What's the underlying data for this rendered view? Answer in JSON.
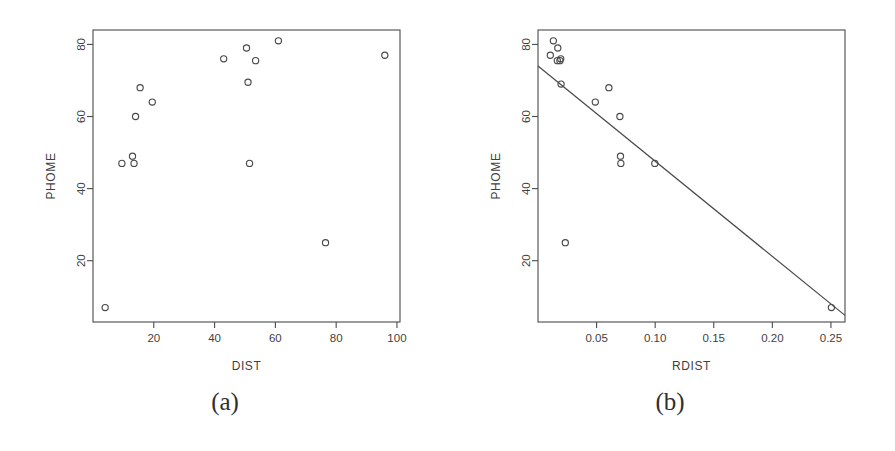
{
  "figure": {
    "background_color": "#ffffff",
    "ink_color": "#4a4a4a",
    "panels": [
      {
        "id": "a",
        "caption": "(a)",
        "xlabel": "DIST",
        "ylabel": "PHOME"
      },
      {
        "id": "b",
        "caption": "(b)",
        "xlabel": "RDIST",
        "ylabel": "PHOME"
      }
    ]
  },
  "chart_data": [
    {
      "type": "scatter",
      "panel": "a",
      "title": "",
      "xlabel": "DIST",
      "ylabel": "PHOME",
      "xlim": [
        0,
        101
      ],
      "ylim": [
        3,
        84
      ],
      "xticks": [
        20,
        40,
        60,
        80,
        100
      ],
      "xtick_labels": [
        "20",
        "40",
        "60",
        "80",
        "100"
      ],
      "yticks": [
        20,
        40,
        60,
        80
      ],
      "ytick_labels": [
        "20",
        "40",
        "60",
        "80"
      ],
      "grid": false,
      "legend": "none",
      "marker": "open-circle",
      "x": [
        4,
        9.5,
        13,
        13.5,
        14,
        15.5,
        19.5,
        43,
        50.5,
        51,
        51.5,
        53.5,
        61,
        76.5,
        96
      ],
      "y": [
        7,
        47,
        49,
        47,
        60,
        68,
        64,
        76,
        79,
        69.5,
        47,
        75.5,
        81,
        25,
        77
      ]
    },
    {
      "type": "scatter",
      "panel": "b",
      "title": "",
      "xlabel": "RDIST",
      "ylabel": "PHOME",
      "xlim": [
        0,
        0.262
      ],
      "ylim": [
        3,
        84
      ],
      "xticks": [
        0.05,
        0.1,
        0.15,
        0.2,
        0.25
      ],
      "xtick_labels": [
        "0.05",
        "0.10",
        "0.15",
        "0.20",
        "0.25"
      ],
      "yticks": [
        20,
        40,
        60,
        80
      ],
      "ytick_labels": [
        "20",
        "40",
        "60",
        "80"
      ],
      "grid": false,
      "legend": "none",
      "marker": "open-circle",
      "x": [
        0.0105,
        0.0131,
        0.0165,
        0.0169,
        0.0187,
        0.0194,
        0.0197,
        0.0233,
        0.0489,
        0.0605,
        0.0699,
        0.0704,
        0.0707,
        0.0997,
        0.2504
      ],
      "y": [
        77,
        81,
        75.5,
        79,
        75.5,
        76,
        69,
        25,
        64,
        68,
        60,
        49,
        47,
        47,
        7
      ],
      "fit_line": {
        "type": "linear",
        "intercept": 74.0,
        "slope": -264.0,
        "x_start": 0.0,
        "x_end": 0.262
      }
    }
  ]
}
